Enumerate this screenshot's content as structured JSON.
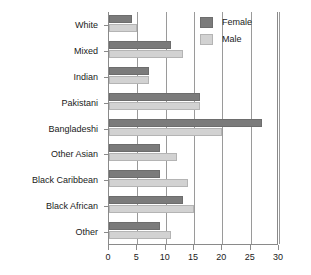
{
  "chart_data": {
    "type": "bar",
    "orientation": "horizontal",
    "title": "",
    "subtitle": "",
    "xlabel": "",
    "ylabel": "",
    "xlim": [
      0,
      30
    ],
    "ylim": null,
    "grid": true,
    "grid_axis": "x",
    "legend_position": "top-right",
    "xticks": [
      0,
      5,
      10,
      15,
      20,
      25,
      30
    ],
    "xtick_labels": [
      "0",
      "5",
      "10",
      "15",
      "20",
      "25",
      "30"
    ],
    "categories": [
      "White",
      "Mixed",
      "Indian",
      "Pakistani",
      "Bangladeshi",
      "Other Asian",
      "Black Caribbean",
      "Black African",
      "Other"
    ],
    "series": [
      {
        "name": "Female",
        "color": "#7b7b7b",
        "values": [
          4,
          11,
          7,
          16,
          27,
          9,
          9,
          13,
          9
        ]
      },
      {
        "name": "Male",
        "color": "#d2d2d2",
        "values": [
          5,
          13,
          7,
          16,
          20,
          12,
          14,
          15,
          11
        ]
      }
    ]
  },
  "legend": {
    "entries": [
      {
        "label": "Female",
        "swatch": "female"
      },
      {
        "label": "Male",
        "swatch": "male"
      }
    ]
  },
  "colors": {
    "female_bar": "#7b7b7b",
    "male_bar": "#d2d2d2",
    "axis": "#8a8a8a",
    "gridline": "#9a9a9a",
    "background": "#ffffff",
    "text": "#1a1a1a"
  }
}
